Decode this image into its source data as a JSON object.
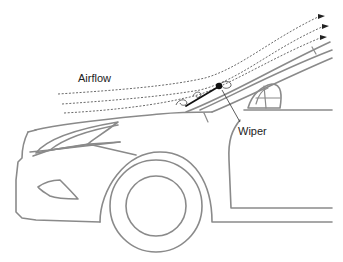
{
  "labels": {
    "airflow": "Airflow",
    "wiper": "Wiper"
  },
  "colors": {
    "car_outline": "#8a8a8a",
    "airflow_lines": "#444444",
    "wiper": "#111111",
    "text": "#222222"
  }
}
